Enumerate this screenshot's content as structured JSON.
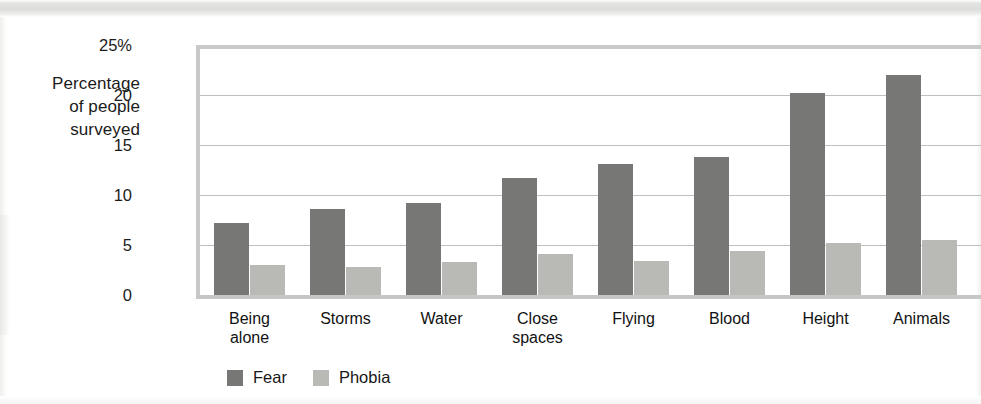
{
  "chart_data": {
    "type": "bar",
    "title": "",
    "subtitle": "",
    "xlabel": "",
    "ylabel": "Percentage of people surveyed",
    "ylabel_lines": [
      "Percentage",
      "of people",
      "surveyed"
    ],
    "categories": [
      "Being alone",
      "Storms",
      "Water",
      "Close spaces",
      "Flying",
      "Blood",
      "Height",
      "Animals"
    ],
    "category_lines": [
      [
        "Being",
        "alone"
      ],
      [
        "Storms"
      ],
      [
        "Water"
      ],
      [
        "Close",
        "spaces"
      ],
      [
        "Flying"
      ],
      [
        "Blood"
      ],
      [
        "Height"
      ],
      [
        "Animals"
      ]
    ],
    "series": [
      {
        "name": "Fear",
        "color": "#777775",
        "values": [
          7.2,
          8.6,
          9.2,
          11.7,
          13.1,
          13.8,
          20.2,
          22.0
        ]
      },
      {
        "name": "Phobia",
        "color": "#b9b9b6",
        "values": [
          3.0,
          2.8,
          3.3,
          4.1,
          3.4,
          4.4,
          5.2,
          5.5
        ]
      }
    ],
    "ylim": [
      0,
      25
    ],
    "yticks": [
      0,
      5,
      10,
      15,
      20,
      25
    ],
    "ytick_labels": [
      "0",
      "5",
      "10",
      "15",
      "20",
      "25%"
    ],
    "grid": true,
    "grid_axis": "y",
    "legend_position": "bottom-left",
    "legend": [
      "Fear",
      "Phobia"
    ]
  },
  "colors": {
    "fear": "#777775",
    "phobia": "#b9b9b6",
    "grid": "#bfbfbd",
    "frame": "#c9c9c7",
    "text": "#171717"
  }
}
